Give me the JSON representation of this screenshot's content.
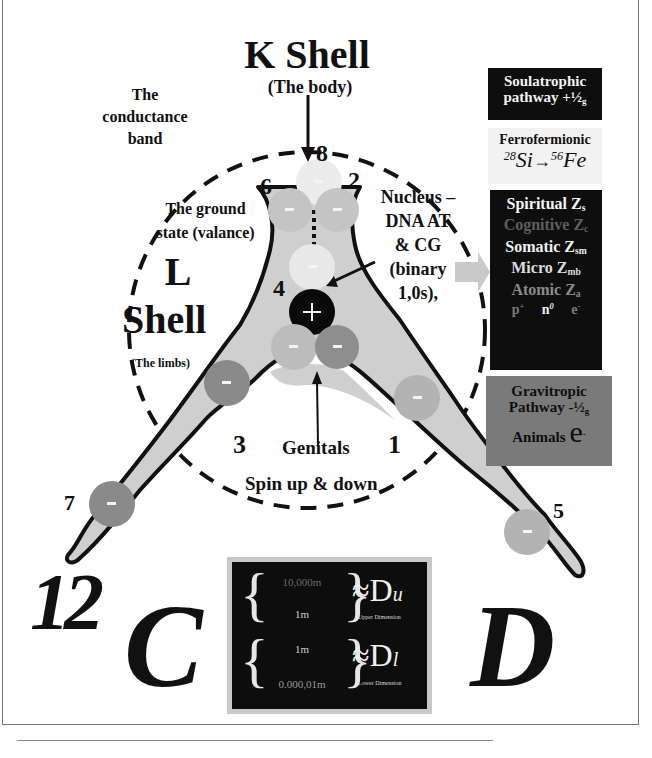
{
  "title": {
    "main": "K Shell",
    "sub": "(The body)"
  },
  "labels": {
    "conductance_band": [
      "The",
      "conductance",
      "band"
    ],
    "ground_state": [
      "The ground",
      "state (valance)"
    ],
    "l_shell": [
      "L",
      "Shell"
    ],
    "l_shell_sub": "(The limbs)",
    "nucleus": [
      "Nucleus –",
      "DNA AT",
      "& CG",
      "(binary",
      "1,0s),"
    ],
    "genitals": "Genitals",
    "spin": "Spin up & down"
  },
  "electron_numbers": [
    "8",
    "6",
    "2",
    "4",
    "3",
    "1",
    "7",
    "5"
  ],
  "charges": {
    "negative": "-",
    "positive": "+"
  },
  "big_letters": {
    "twelve": "12",
    "c": "C",
    "d": "D"
  },
  "right_panel": {
    "soulatrophic": {
      "line1": "Soulatrophic",
      "line2": "pathway +½",
      "line2_sub": "g"
    },
    "ferrofermionic": {
      "title": "Ferrofermionic",
      "from_mass": "28",
      "from_el": "Si",
      "arrow": "→",
      "to_mass": "56",
      "to_el": "Fe"
    },
    "levels": [
      {
        "name": "Spiritual Z",
        "sub": "s",
        "tone": "bright"
      },
      {
        "name": "Cognitive Z",
        "sub": "c",
        "tone": "dim"
      },
      {
        "name": "Somatic Z",
        "sub": "sm",
        "tone": "bright"
      },
      {
        "name": "Micro Z",
        "sub": "mb",
        "tone": "light"
      },
      {
        "name": "Atomic  Z",
        "sub": "a",
        "tone": "mid"
      }
    ],
    "particles": [
      {
        "base": "p",
        "sup": "+"
      },
      {
        "base": "n",
        "sup": "0"
      },
      {
        "base": "e",
        "sup": "-"
      }
    ],
    "gravitropic": {
      "line1": "Gravitropic",
      "line2": "Pathway -½",
      "line2_sub": "g",
      "line3": "Animals",
      "e": "e",
      "e_sup": "-"
    }
  },
  "dimension_box": {
    "upper": {
      "top": "10,000m",
      "bottom": "1m",
      "symbol": "≈D",
      "sub": "u",
      "caption": "Upper Dimension"
    },
    "lower": {
      "top": "1m",
      "bottom": "0.000,01m",
      "symbol": "≈D",
      "sub": "l",
      "caption": "Lower Dimension"
    }
  },
  "colors": {
    "body_fill": "#cfcfcf",
    "outline": "#111111",
    "electron_light": "#e6e6e6",
    "electron_mid": "#b9b9b9",
    "electron_dark": "#8c8c8c",
    "nucleus": "#0a0a0a",
    "dark_panel": "#0e0e0e",
    "gravitropic_panel": "#7a7a7a"
  }
}
